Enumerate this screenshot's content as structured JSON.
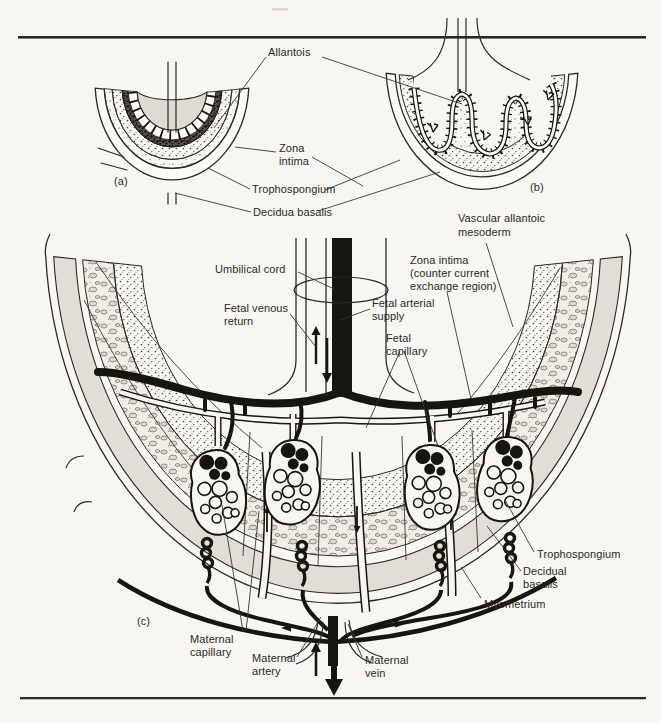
{
  "document_type": "textbook anatomical figure",
  "colors": {
    "paper": "#f7f6f2",
    "ink": "#2b2925",
    "vessel_black": "#17150f",
    "tissue_gray": "#e0ded6"
  },
  "figure": {
    "panel_tags": {
      "a": "(a)",
      "b": "(b)",
      "c": "(c)"
    },
    "shared_labels": {
      "allantois": "Allantois",
      "zona_intima": [
        "Zona",
        "intima"
      ],
      "trophospongium": "Trophospongium",
      "decidua_basalis": "Decidua basalis",
      "vascular_allantoic_mesoderm": [
        "Vascular allantoic",
        "mesoderm"
      ]
    },
    "panel_c_labels": {
      "umbilical_cord": "Umbilical cord",
      "fetal_venous_return": [
        "Fetal venous",
        "return"
      ],
      "fetal_arterial_supply": [
        "Fetal arterial",
        "supply"
      ],
      "fetal_capillary": [
        "Fetal",
        "capillary"
      ],
      "zona_intima_counter": [
        "Zona intima",
        "(counter current",
        "exchange region)"
      ],
      "trophospongium": "Trophospongium",
      "decidual_basalis": [
        "Decidual",
        "basalis"
      ],
      "myometrium": "Myometrium",
      "maternal_capillary": [
        "Maternal",
        "capillary"
      ],
      "maternal_artery": [
        "Maternal",
        "artery"
      ],
      "maternal_vein": [
        "Maternal",
        "vein"
      ]
    }
  }
}
